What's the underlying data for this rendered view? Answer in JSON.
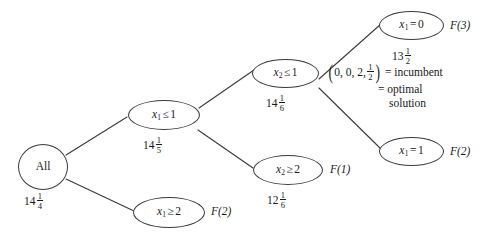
{
  "diagram": {
    "stroke_color": "#3a3a3a",
    "text_color": "#1a1a1a",
    "background": "#ffffff",
    "nodes": [
      {
        "id": "root",
        "label": "All",
        "value_int": "14",
        "value_num": "1",
        "value_den": "4",
        "flabel": ""
      },
      {
        "id": "x1-le-1",
        "label": "x",
        "sub": "1",
        "rel": "≤",
        "rhs": "1",
        "value_int": "14",
        "value_num": "1",
        "value_den": "5",
        "flabel": ""
      },
      {
        "id": "x1-ge-2",
        "label": "x",
        "sub": "1",
        "rel": "≥",
        "rhs": "2",
        "value_int": "",
        "value_num": "",
        "value_den": "",
        "flabel": "F(2)"
      },
      {
        "id": "x2-le-1",
        "label": "x",
        "sub": "2",
        "rel": "≤",
        "rhs": "1",
        "value_int": "14",
        "value_num": "1",
        "value_den": "6",
        "flabel": ""
      },
      {
        "id": "x2-ge-2",
        "label": "x",
        "sub": "2",
        "rel": "≥",
        "rhs": "2",
        "value_int": "12",
        "value_num": "1",
        "value_den": "6",
        "flabel": "F(1)"
      },
      {
        "id": "x1-eq-0",
        "label": "x",
        "sub": "1",
        "rel": "=",
        "rhs": "0",
        "value_int": "13",
        "value_num": "1",
        "value_den": "2",
        "flabel": "F(3)"
      },
      {
        "id": "x1-eq-1",
        "label": "x",
        "sub": "1",
        "rel": "=",
        "rhs": "1",
        "value_int": "",
        "value_num": "",
        "value_den": "",
        "flabel": "F(2)"
      }
    ],
    "annotation": {
      "tuple_open": "(",
      "tuple_values": "0, 0, 2, ",
      "tuple_frac_num": "1",
      "tuple_frac_den": "2",
      "tuple_close": ")",
      "line1": "= incumbent",
      "line2": "= optimal",
      "line3": "solution"
    }
  }
}
